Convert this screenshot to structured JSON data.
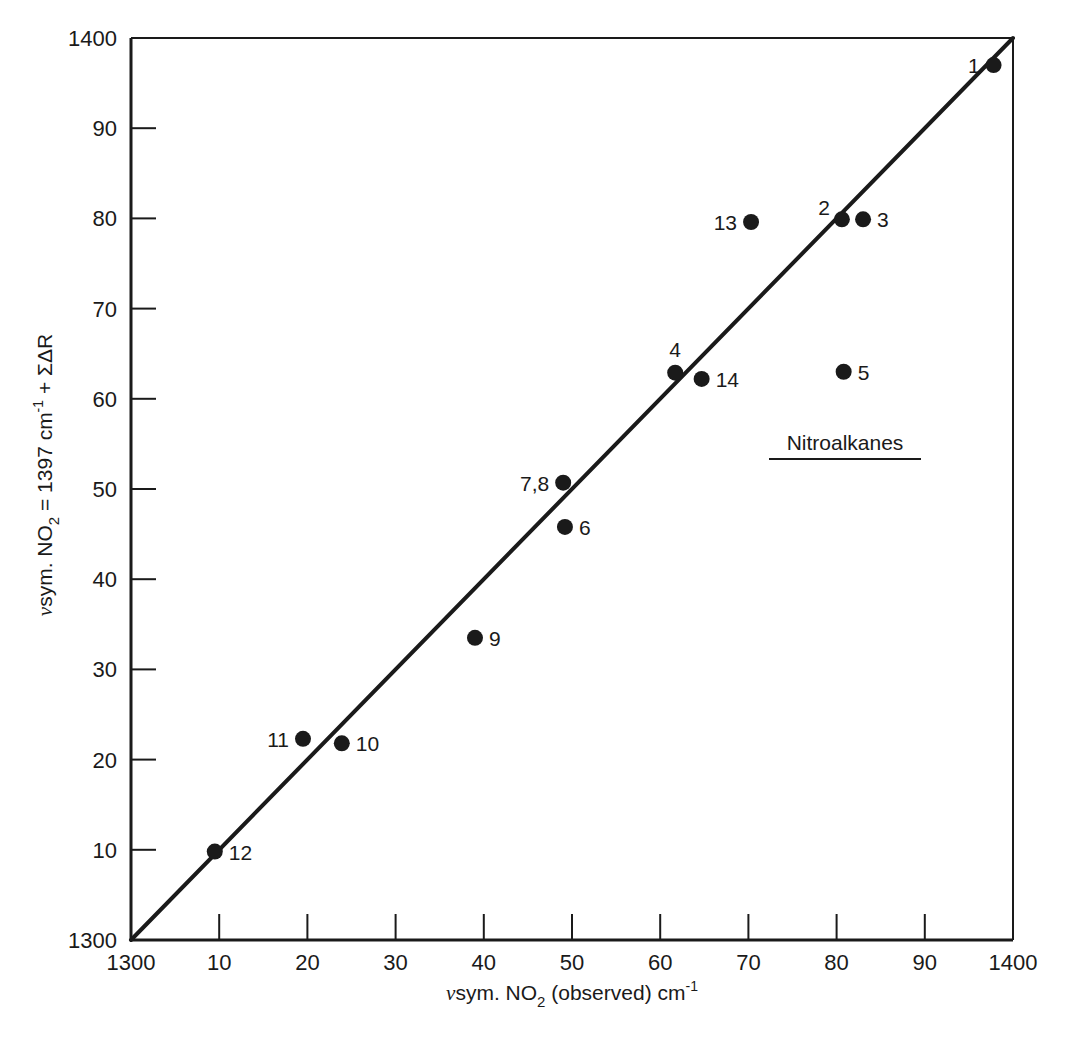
{
  "chart_data": {
    "type": "scatter",
    "title": "",
    "xlabel": "νsym. NO2 (observed) cm-1",
    "ylabel": "νsym. NO2 = 1397 cm-1 + ΣΔR",
    "xlabel_parts": {
      "nu": "ν",
      "main": "sym. NO",
      "sub": "2",
      "rest": " (observed) cm",
      "sup": "-1"
    },
    "ylabel_parts": {
      "nu": "ν",
      "main": "sym. NO",
      "sub": "2",
      "mid": " = 1397 cm",
      "sup": "-1",
      "rest": " + ΣΔR"
    },
    "xlim": [
      1300,
      1400
    ],
    "ylim": [
      1300,
      1400
    ],
    "x_ticks": [
      1300,
      1310,
      1320,
      1330,
      1340,
      1350,
      1360,
      1370,
      1380,
      1390,
      1400
    ],
    "x_tick_labels": [
      "1300",
      "10",
      "20",
      "30",
      "40",
      "50",
      "60",
      "70",
      "80",
      "90",
      "1400"
    ],
    "y_ticks": [
      1300,
      1310,
      1320,
      1330,
      1340,
      1350,
      1360,
      1370,
      1380,
      1390,
      1400
    ],
    "y_tick_labels": [
      "1300",
      "10",
      "20",
      "30",
      "40",
      "50",
      "60",
      "70",
      "80",
      "90",
      "1400"
    ],
    "grid": false,
    "legend": null,
    "annotation": "Nitroalkanes",
    "reference_line": {
      "from": [
        1300,
        1300
      ],
      "to": [
        1400,
        1400
      ],
      "label": "y = x"
    },
    "points": [
      {
        "label": "1",
        "x": 1397.8,
        "y": 1397.0,
        "label_pos": "left"
      },
      {
        "label": "2",
        "x": 1380.6,
        "y": 1379.9,
        "label_pos": "upper-left"
      },
      {
        "label": "3",
        "x": 1383.0,
        "y": 1379.9,
        "label_pos": "right"
      },
      {
        "label": "4",
        "x": 1361.7,
        "y": 1362.9,
        "label_pos": "above"
      },
      {
        "label": "5",
        "x": 1380.8,
        "y": 1363.0,
        "label_pos": "right"
      },
      {
        "label": "6",
        "x": 1349.2,
        "y": 1345.8,
        "label_pos": "right"
      },
      {
        "label": "7,8",
        "x": 1349.0,
        "y": 1350.7,
        "label_pos": "left"
      },
      {
        "label": "9",
        "x": 1339.0,
        "y": 1333.5,
        "label_pos": "right"
      },
      {
        "label": "10",
        "x": 1323.9,
        "y": 1321.8,
        "label_pos": "right"
      },
      {
        "label": "11",
        "x": 1319.5,
        "y": 1322.3,
        "label_pos": "left"
      },
      {
        "label": "12",
        "x": 1309.5,
        "y": 1309.8,
        "label_pos": "right"
      },
      {
        "label": "13",
        "x": 1370.3,
        "y": 1379.6,
        "label_pos": "left"
      },
      {
        "label": "14",
        "x": 1364.7,
        "y": 1362.2,
        "label_pos": "right"
      }
    ]
  },
  "layout": {
    "plot_left": 131,
    "plot_right": 1013,
    "plot_top": 38,
    "plot_bottom": 940,
    "ink": "#1a1a1a"
  }
}
